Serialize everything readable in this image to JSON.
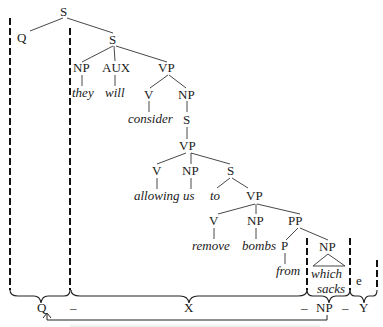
{
  "tree": {
    "root": "S",
    "q": "Q",
    "s2": "S",
    "np_they": "NP",
    "they": "they",
    "aux": "AUX",
    "will": "will",
    "vp1": "VP",
    "v1": "V",
    "consider": "consider",
    "np1": "NP",
    "s3": "S",
    "vp2": "VP",
    "v2": "V",
    "allowing": "allowing",
    "np_us": "NP",
    "us": "us",
    "s4": "S",
    "to": "to",
    "vp3": "VP",
    "v3": "V",
    "remove": "remove",
    "np_bombs": "NP",
    "bombs": "bombs",
    "pp": "PP",
    "p": "P",
    "from": "from",
    "np_wh": "NP",
    "which": "which",
    "sacks": "sacks",
    "empty": "e"
  },
  "analysis": {
    "q": "Q",
    "dash1": "–",
    "x": "X",
    "dash2": "–",
    "np": "NP",
    "dash3": "–",
    "y": "Y"
  }
}
